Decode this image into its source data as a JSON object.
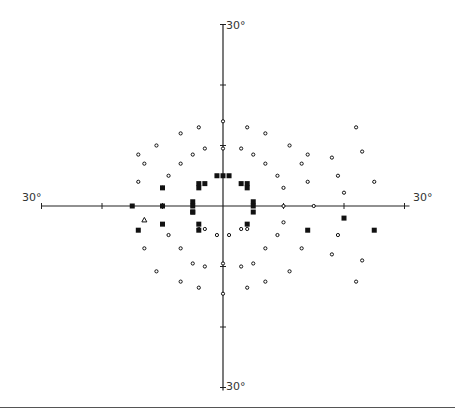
{
  "chart_data": {
    "type": "scatter",
    "xlabel": "",
    "ylabel": "",
    "xlim": [
      -30,
      30
    ],
    "ylim": [
      -30,
      30
    ],
    "grid": false,
    "axis_labels": {
      "top": "30°",
      "bottom": "30°",
      "left": "30°",
      "right": "30°"
    },
    "axis_ticks_deg": [
      -30,
      -20,
      -10,
      0,
      10,
      20,
      30
    ],
    "legend": [],
    "series": [
      {
        "name": "seen (small circle)",
        "marker": "circle",
        "points": [
          [
            0,
            14
          ],
          [
            0,
            9.5
          ],
          [
            0,
            -9.5
          ],
          [
            0,
            -14.5
          ],
          [
            -4,
            13
          ],
          [
            4,
            13
          ],
          [
            -7,
            12
          ],
          [
            7,
            12
          ],
          [
            -11,
            10
          ],
          [
            11,
            10
          ],
          [
            -14,
            8.5
          ],
          [
            14,
            8.5
          ],
          [
            -3,
            9.5
          ],
          [
            3,
            9.5
          ],
          [
            -5,
            8.5
          ],
          [
            5,
            8.5
          ],
          [
            -7,
            7
          ],
          [
            7,
            7
          ],
          [
            -9,
            5
          ],
          [
            9,
            5
          ],
          [
            -13,
            7
          ],
          [
            13,
            7
          ],
          [
            -14,
            4
          ],
          [
            14,
            4
          ],
          [
            -10,
            3
          ],
          [
            10,
            3
          ],
          [
            -3,
            -3.8
          ],
          [
            3,
            -3.8
          ],
          [
            -1,
            -4.8
          ],
          [
            1,
            -4.8
          ],
          [
            -4,
            -3.8
          ],
          [
            4,
            -3.8
          ],
          [
            -9,
            -4.8
          ],
          [
            9,
            -4.8
          ],
          [
            -13,
            -7
          ],
          [
            13,
            -7
          ],
          [
            -7,
            -7
          ],
          [
            7,
            -7
          ],
          [
            -5,
            -9.5
          ],
          [
            5,
            -9.5
          ],
          [
            -3,
            -10
          ],
          [
            3,
            -10
          ],
          [
            -11,
            -10.8
          ],
          [
            11,
            -10.8
          ],
          [
            -7,
            -12.5
          ],
          [
            7,
            -12.5
          ],
          [
            -4,
            -13.5
          ],
          [
            4,
            -13.5
          ],
          [
            10,
            0
          ],
          [
            15,
            0
          ],
          [
            10,
            -2.7
          ],
          [
            18,
            8
          ],
          [
            19,
            5
          ],
          [
            22,
            13
          ],
          [
            23,
            9
          ],
          [
            25,
            4
          ],
          [
            20,
            2.2
          ],
          [
            19,
            -4.8
          ],
          [
            18,
            -8
          ],
          [
            23,
            -9
          ],
          [
            22,
            -12.5
          ]
        ]
      },
      {
        "name": "not seen (black square)",
        "marker": "square",
        "points": [
          [
            -1,
            5
          ],
          [
            0,
            5
          ],
          [
            1,
            5
          ],
          [
            -4,
            3.7
          ],
          [
            -3,
            3.7
          ],
          [
            -4,
            3
          ],
          [
            3,
            3.7
          ],
          [
            4,
            3.7
          ],
          [
            4,
            3
          ],
          [
            -5,
            0.7
          ],
          [
            -5,
            0
          ],
          [
            -5,
            -1
          ],
          [
            5,
            0.7
          ],
          [
            5,
            0
          ],
          [
            -5,
            -1
          ],
          [
            5,
            -1
          ],
          [
            -4,
            -3
          ],
          [
            -4,
            -4
          ],
          [
            4,
            -3
          ],
          [
            -10,
            3
          ],
          [
            -10,
            0
          ],
          [
            -10,
            -3
          ],
          [
            -15,
            0
          ],
          [
            -14,
            -4
          ],
          [
            14,
            -4
          ],
          [
            20,
            -2
          ],
          [
            25,
            -4
          ]
        ]
      },
      {
        "name": "relative defect (triangle)",
        "marker": "triangle",
        "points": [
          [
            -13,
            -2.3
          ]
        ]
      }
    ]
  },
  "layout": {
    "center_px": [
      223,
      206
    ],
    "px_per_deg": 6.05,
    "colors": {
      "axis": "#222222",
      "marker": "#111111",
      "background": "#ffffff",
      "divider": "#555555"
    }
  }
}
